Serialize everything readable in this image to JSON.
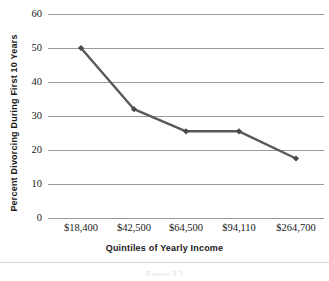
{
  "chart_data": {
    "type": "line",
    "title": "",
    "xlabel": "Quintiles of Yearly Income",
    "ylabel": "Percent Divorcing During First 10 Years",
    "categories": [
      "$18,400",
      "$42,500",
      "$64,500",
      "$94,110",
      "$264,700"
    ],
    "values": [
      50,
      32,
      25.5,
      25.5,
      17.5
    ],
    "series": [
      {
        "name": "Percent Divorcing During First 10 Years",
        "values": [
          50,
          32,
          25.5,
          25.5,
          17.5
        ]
      }
    ],
    "ylim": [
      0,
      60
    ],
    "yticks": [
      0,
      10,
      20,
      30,
      40,
      50,
      60
    ],
    "ytick_labels": [
      "0",
      "10",
      "20",
      "30",
      "40",
      "50",
      "60"
    ],
    "grid": "horizontal",
    "legend": "none",
    "marker": "diamond",
    "line_color": "#595959",
    "marker_color": "#4a4a4a",
    "gridline_color": "#9a9a9a"
  },
  "caption": "Figure 3.3"
}
